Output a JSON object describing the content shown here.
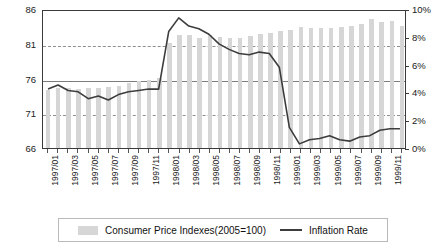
{
  "chart_data": {
    "type": "bar",
    "title": "",
    "subtitle": "",
    "xlabel": "",
    "ylabel": "",
    "grid": true,
    "legend_position": "bottom",
    "categories": [
      "1997/01",
      "1997/02",
      "1997/03",
      "1997/04",
      "1997/05",
      "1997/06",
      "1997/07",
      "1997/08",
      "1997/09",
      "1997/10",
      "1997/11",
      "1997/12",
      "1998/01",
      "1998/02",
      "1998/03",
      "1998/04",
      "1998/05",
      "1998/06",
      "1998/07",
      "1998/08",
      "1998/09",
      "1998/10",
      "1998/11",
      "1998/12",
      "1999/01",
      "1999/02",
      "1999/03",
      "1999/04",
      "1999/05",
      "1999/06",
      "1999/07",
      "1999/08",
      "1999/09",
      "1999/10",
      "1999/11",
      "1999/12"
    ],
    "x_tick_labels": [
      "1997/01",
      "1997/03",
      "1997/05",
      "1997/07",
      "1997/09",
      "1997/11",
      "1998/01",
      "1998/03",
      "1998/05",
      "1998/07",
      "1998/09",
      "1998/11",
      "1999/01",
      "1999/03",
      "1999/05",
      "1999/07",
      "1999/09",
      "1999/11"
    ],
    "left_axis": {
      "name": "Consumer Price Indexes(2005=100)",
      "ylim": [
        66,
        86
      ],
      "ticks": [
        66,
        71,
        76,
        81,
        86
      ],
      "tick_labels": [
        "66",
        "71",
        "76",
        "81",
        "86"
      ]
    },
    "right_axis": {
      "name": "Inflation Rate",
      "ylim": [
        0,
        10
      ],
      "ticks": [
        0,
        2,
        4,
        6,
        8,
        10
      ],
      "tick_labels": [
        "0%",
        "2%",
        "4%",
        "6%",
        "8%",
        "10%"
      ]
    },
    "series": [
      {
        "name": "Consumer Price Indexes(2005=100)",
        "type": "bar",
        "axis": "left",
        "color": "#d6d6d6",
        "values": [
          74.4,
          74.6,
          74.6,
          74.5,
          74.6,
          74.7,
          74.8,
          74.9,
          75.3,
          75.6,
          75.8,
          76.1,
          81.1,
          82.3,
          82.2,
          81.9,
          82.3,
          82.0,
          81.9,
          81.8,
          82.1,
          82.4,
          82.6,
          82.9,
          83.0,
          83.4,
          83.2,
          83.3,
          83.2,
          83.4,
          83.6,
          83.8,
          84.5,
          84.1,
          84.3,
          83.6
        ]
      },
      {
        "name": "Inflation Rate",
        "type": "line",
        "axis": "right",
        "color": "#3d3d3d",
        "values": [
          4.3,
          4.6,
          4.2,
          4.1,
          3.6,
          3.8,
          3.5,
          3.9,
          4.1,
          4.2,
          4.3,
          4.3,
          8.5,
          9.5,
          8.9,
          8.7,
          8.3,
          7.6,
          7.2,
          6.9,
          6.8,
          7.0,
          6.9,
          5.9,
          1.5,
          0.3,
          0.6,
          0.7,
          0.9,
          0.6,
          0.5,
          0.8,
          0.9,
          1.3,
          1.4,
          1.4
        ]
      }
    ]
  },
  "legend": {
    "bar_label": "Consumer Price Indexes(2005=100)",
    "line_label": "Inflation Rate"
  }
}
